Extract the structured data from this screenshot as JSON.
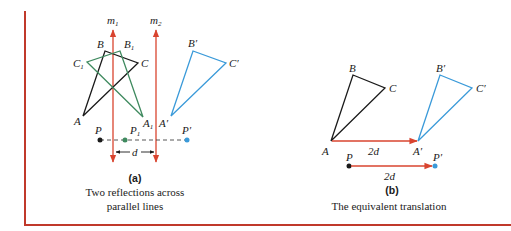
{
  "colors": {
    "frame": "#c0392b",
    "mirror": "#d9442f",
    "original": "#1a1a1a",
    "intermediate": "#3f8a5f",
    "image": "#3a9ad9",
    "translation_arrow": "#d9442f"
  },
  "panel_a": {
    "tag": "(a)",
    "caption_line1": "Two reflections across",
    "caption_line2": "parallel lines",
    "mirror1": {
      "name": "m",
      "sub": "1"
    },
    "mirror2": {
      "name": "m",
      "sub": "2"
    },
    "triangle_original": {
      "A": "A",
      "B": "B",
      "C": "C"
    },
    "triangle_intermediate": {
      "A": "A",
      "B": "B",
      "C": "C",
      "sub": "1"
    },
    "triangle_image": {
      "A": "A′",
      "B": "B′",
      "C": "C′"
    },
    "point_P": "P",
    "point_P1": {
      "name": "P",
      "sub": "1"
    },
    "point_Pprime": "P′",
    "distance_label": "d"
  },
  "panel_b": {
    "tag": "(b)",
    "caption": "The equivalent translation",
    "triangle_original": {
      "A": "A",
      "B": "B",
      "C": "C"
    },
    "triangle_image": {
      "A": "A′",
      "B": "B′",
      "C": "C′"
    },
    "vector_label_triangle": "2d",
    "point_P": "P",
    "point_Pprime": "P′",
    "vector_label_point": "2d"
  }
}
